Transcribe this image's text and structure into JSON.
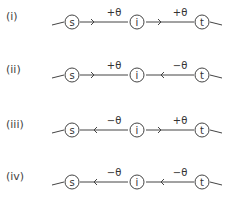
{
  "diagram": {
    "nodes": [
      "s",
      "i",
      "t"
    ],
    "rows": [
      {
        "label": "(i)",
        "left_edge": "+θ",
        "left_dir": "right",
        "right_edge": "+θ",
        "right_dir": "right"
      },
      {
        "label": "(ii)",
        "left_edge": "+θ",
        "left_dir": "right",
        "right_edge": "−θ",
        "right_dir": "left"
      },
      {
        "label": "(iii)",
        "left_edge": "−θ",
        "left_dir": "left",
        "right_edge": "+θ",
        "right_dir": "right"
      },
      {
        "label": "(iv)",
        "left_edge": "−θ",
        "left_dir": "left",
        "right_edge": "−θ",
        "right_dir": "left"
      }
    ]
  }
}
